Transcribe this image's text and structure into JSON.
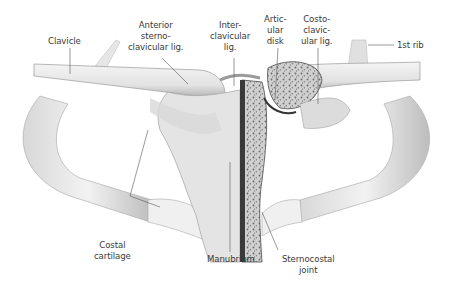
{
  "figure": {
    "labels": {
      "clavicle": [
        "Clavicle"
      ],
      "anterior_sternoclavicular_lig": [
        "Anterior",
        "sterno-",
        "clavicular lig."
      ],
      "interclavicular_lig": [
        "Inter-",
        "clavicular",
        "lig."
      ],
      "articular_disk": [
        "Artic-",
        "ular",
        "disk"
      ],
      "costoclavicular_lig": [
        "Costo-",
        "clavic-",
        "ular lig."
      ],
      "first_rib": [
        "1st rib"
      ],
      "costal_cartilage": [
        "Costal",
        "cartilage"
      ],
      "manubrium": [
        "Manubrium"
      ],
      "sternocostal_joint": [
        "Sternocostal",
        "joint"
      ]
    },
    "colors": {
      "bone_light": "#efefef",
      "bone_mid": "#d4d4d4",
      "bone_dark": "#8a8a8a",
      "cancellous": "#7a7a7a",
      "leader_line": "#555555",
      "text": "#3a3a3a"
    }
  }
}
